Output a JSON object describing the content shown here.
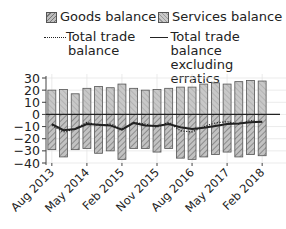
{
  "legend": {
    "goods": "Goods balance",
    "services": "Services balance",
    "total": "Total trade balance",
    "total_line1": "Total trade",
    "total_line2": "balance",
    "excl_line1": "Total trade",
    "excl_line2": "balance excluding",
    "excl_line3": "erratics"
  },
  "colors": {
    "goods_fill": "#bdbdbd",
    "services_fill": "#c4c4c4",
    "bar_stroke": "#555555",
    "line": "#222222",
    "grid": "#e6e6e6"
  },
  "chart_data": {
    "type": "bar",
    "title": "",
    "xlabel": "",
    "ylabel": "",
    "ylim": [
      -40,
      30
    ],
    "yticks": [
      30,
      20,
      10,
      0,
      -10,
      -20,
      -30,
      -40
    ],
    "xtick_labels": [
      "Aug 2013",
      "May 2014",
      "Feb 2015",
      "Nov 2015",
      "Aug 2016",
      "May 2017",
      "Feb 2018"
    ],
    "categories": [
      "Aug 2013",
      "Nov 2013",
      "Feb 2014",
      "May 2014",
      "Aug 2014",
      "Nov 2014",
      "Feb 2015",
      "May 2015",
      "Aug 2015",
      "Nov 2015",
      "Feb 2016",
      "May 2016",
      "Aug 2016",
      "Nov 2016",
      "Feb 2017",
      "May 2017",
      "Aug 2017",
      "Nov 2017",
      "Feb 2018"
    ],
    "grid": true,
    "legend_position": "top",
    "series": [
      {
        "name": "Services balance",
        "type": "bar",
        "values": [
          20,
          20.5,
          17,
          21.5,
          23,
          22,
          25,
          21.5,
          20,
          20.5,
          21.5,
          22.5,
          22.5,
          25,
          26,
          25,
          27,
          28,
          27.5
        ]
      },
      {
        "name": "Goods balance",
        "type": "bar",
        "values": [
          -29,
          -35,
          -29,
          -28,
          -32,
          -30,
          -37,
          -28,
          -28,
          -31,
          -28,
          -36,
          -37,
          -35,
          -33,
          -31,
          -35,
          -33,
          -34
        ]
      },
      {
        "name": "Total trade balance",
        "type": "line",
        "style": "dotted",
        "values": [
          -9,
          -14.5,
          -12,
          -6.5,
          -9,
          -8,
          -12,
          -6.5,
          -8,
          -10.5,
          -6.5,
          -13.5,
          -14.5,
          -10,
          -7,
          -6,
          -8,
          -5,
          -6.5
        ]
      },
      {
        "name": "Total trade balance excluding erratics",
        "type": "line",
        "style": "solid",
        "values": [
          -8,
          -13,
          -12,
          -8,
          -8.5,
          -9,
          -12.5,
          -7,
          -9,
          -9.5,
          -8,
          -10.5,
          -12,
          -11,
          -9.5,
          -8,
          -7.5,
          -6.5,
          -6
        ]
      }
    ]
  }
}
